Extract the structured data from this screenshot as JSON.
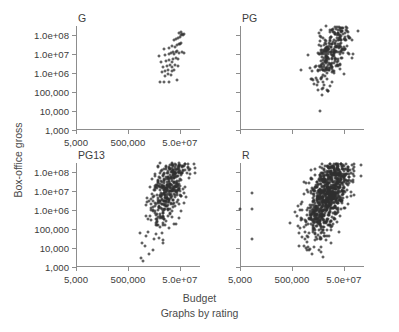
{
  "chart_data": {
    "type": "scatter",
    "title": "",
    "subtitle": "Graphs by rating",
    "xlabel": "Budget",
    "ylabel": "Box-office gross",
    "xscale": "log",
    "yscale": "log",
    "grid": false,
    "legend": "none",
    "layout": "2x2 small multiples by rating",
    "xlim": [
      5000,
      300000000
    ],
    "ylim": [
      1000,
      300000000
    ],
    "xticks": [
      {
        "value": 5000,
        "label": "5,000"
      },
      {
        "value": 500000,
        "label": "500,000"
      },
      {
        "value": 50000000,
        "label": "5.0e+07"
      }
    ],
    "yticks": [
      {
        "value": 100000000,
        "label": "1.0e+08"
      },
      {
        "value": 10000000,
        "label": "1.0e+07"
      },
      {
        "value": 1000000,
        "label": "1.0e+06"
      },
      {
        "value": 100000,
        "label": "100,000"
      },
      {
        "value": 10000,
        "label": "10,000"
      },
      {
        "value": 1000,
        "label": "1,000"
      }
    ],
    "marker": {
      "shape": "open-circle",
      "size": 3,
      "color": "#2e2e2e"
    },
    "panels": [
      {
        "id": "G",
        "label": "G",
        "position": "top-left",
        "n": 54,
        "x_axis_labeled": true,
        "y_axis_labeled": true,
        "points": [
          [
            9000000,
            330000
          ],
          [
            12000000,
            340000
          ],
          [
            20000000,
            350000
          ],
          [
            38000000,
            430000
          ],
          [
            14000000,
            700000
          ],
          [
            17000000,
            900000
          ],
          [
            22000000,
            820000
          ],
          [
            10000000,
            1100000
          ],
          [
            13000000,
            1300000
          ],
          [
            18000000,
            1450000
          ],
          [
            25000000,
            1250000
          ],
          [
            30000000,
            1500000
          ],
          [
            11000000,
            2000000
          ],
          [
            16000000,
            2300000
          ],
          [
            21000000,
            2600000
          ],
          [
            26000000,
            2200000
          ],
          [
            33000000,
            2800000
          ],
          [
            41000000,
            2400000
          ],
          [
            9500000,
            3600000
          ],
          [
            15000000,
            4200000
          ],
          [
            19000000,
            4800000
          ],
          [
            24000000,
            4000000
          ],
          [
            28000000,
            5200000
          ],
          [
            35000000,
            6000000
          ],
          [
            44000000,
            5500000
          ],
          [
            8000000,
            7800000
          ],
          [
            13500000,
            8500000
          ],
          [
            18500000,
            9500000
          ],
          [
            23000000,
            11000000
          ],
          [
            27000000,
            12500000
          ],
          [
            31000000,
            10500000
          ],
          [
            36000000,
            13000000
          ],
          [
            40000000,
            14500000
          ],
          [
            47000000,
            12000000
          ],
          [
            60000000,
            13500000
          ],
          [
            75000000,
            11500000
          ],
          [
            12000000,
            18000000
          ],
          [
            20000000,
            22000000
          ],
          [
            26000000,
            26000000
          ],
          [
            32000000,
            24000000
          ],
          [
            38000000,
            30000000
          ],
          [
            45000000,
            35000000
          ],
          [
            52000000,
            32000000
          ],
          [
            58000000,
            40000000
          ],
          [
            30000000,
            55000000
          ],
          [
            36000000,
            62000000
          ],
          [
            43000000,
            70000000
          ],
          [
            50000000,
            80000000
          ],
          [
            56000000,
            95000000
          ],
          [
            62000000,
            110000000
          ],
          [
            48000000,
            130000000
          ],
          [
            55000000,
            150000000
          ],
          [
            66000000,
            100000000
          ],
          [
            70000000,
            120000000
          ]
        ]
      },
      {
        "id": "PG",
        "label": "PG",
        "position": "top-right",
        "n": 300,
        "x_axis_labeled": false,
        "y_axis_labeled": false,
        "points": []
      },
      {
        "id": "PG13",
        "label": "PG13",
        "position": "bottom-left",
        "n": 420,
        "x_axis_labeled": true,
        "y_axis_labeled": true,
        "points": []
      },
      {
        "id": "R",
        "label": "R",
        "position": "bottom-right",
        "n": 900,
        "x_axis_labeled": true,
        "y_axis_labeled": false,
        "outliers": [
          [
            5200,
            1200000
          ],
          [
            14000,
            8000000
          ],
          [
            15000,
            1100000
          ],
          [
            15000,
            30000
          ]
        ],
        "points": []
      }
    ]
  }
}
